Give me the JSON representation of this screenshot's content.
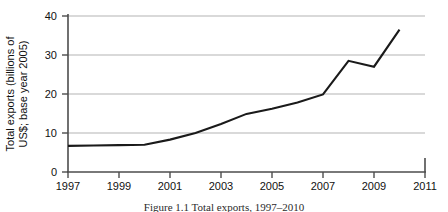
{
  "chart_data": {
    "type": "line",
    "title": "",
    "xlabel": "",
    "ylabel": "Total exports (billions of US$; base year 2005)",
    "ylabel_line1": "Total exports (billions of",
    "ylabel_line2": "US$; base year 2005)",
    "x": [
      1997,
      1998,
      1999,
      2000,
      2001,
      2002,
      2003,
      2004,
      2005,
      2006,
      2007,
      2008,
      2009,
      2010
    ],
    "values": [
      6.7,
      6.8,
      6.9,
      7.0,
      8.3,
      10.0,
      12.3,
      14.9,
      16.2,
      17.8,
      19.9,
      28.5,
      27.0,
      36.5
    ],
    "series": [
      {
        "name": "Total exports",
        "values": [
          6.7,
          6.8,
          6.9,
          7.0,
          8.3,
          10.0,
          12.3,
          14.9,
          16.2,
          17.8,
          19.9,
          28.5,
          27.0,
          36.5
        ]
      }
    ],
    "xlim": [
      1997,
      2011
    ],
    "ylim": [
      0,
      40
    ],
    "x_ticks": [
      1997,
      1999,
      2001,
      2003,
      2005,
      2007,
      2009,
      2011
    ],
    "x_tick_labels": [
      "1997",
      "1999",
      "2001",
      "2003",
      "2005",
      "2007",
      "2009",
      "2011"
    ],
    "y_ticks": [
      0,
      10,
      20,
      30,
      40
    ],
    "y_tick_labels": [
      "0",
      "10",
      "20",
      "30",
      "40"
    ],
    "grid": "horizontal",
    "legend": "none",
    "line_color": "#1a1a1a",
    "grid_color": "#b3b3b3",
    "axis_color": "#4d4d4d",
    "background_color": "#ffffff"
  },
  "caption": {
    "text": "Figure 1.1 Total exports, 1997–2010"
  }
}
